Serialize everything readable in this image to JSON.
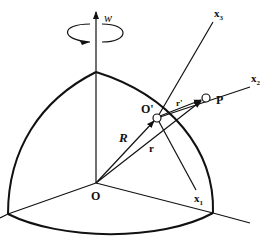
{
  "figure": {
    "labels": {
      "omega": "w",
      "x3": "x",
      "x3_sub": "3",
      "x2": "x",
      "x2_sub": "2",
      "x1": "x",
      "x1_sub": "1",
      "origin": "O",
      "moving_origin": "O'",
      "point": "P",
      "R": "R",
      "r": "r",
      "r_prime": "r'"
    },
    "colors": {
      "stroke": "#111111",
      "background": "#ffffff"
    }
  }
}
